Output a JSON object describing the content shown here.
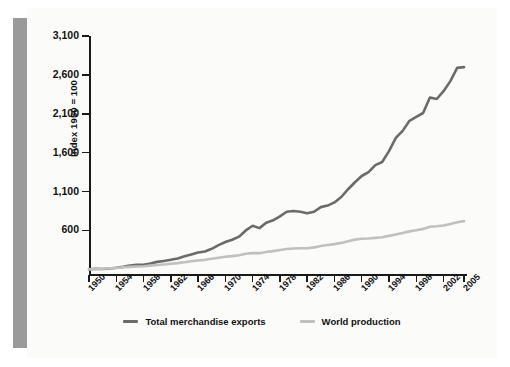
{
  "figure": {
    "ylabel": "Index 1950 = 100"
  },
  "legend": {
    "items": [
      {
        "label": "Total merchandise exports",
        "color": "#6b6b6b",
        "key": "exports"
      },
      {
        "label": "World production",
        "color": "#c0c0c0",
        "key": "production"
      }
    ]
  },
  "chart_data": {
    "type": "line",
    "title": "",
    "xlabel": "",
    "ylabel": "Index 1950 = 100",
    "grid": false,
    "legend_position": "bottom-center",
    "xlim": [
      1950,
      2005
    ],
    "ylim": [
      40,
      3100
    ],
    "yticks": [
      600,
      1100,
      1600,
      2100,
      2600,
      3100
    ],
    "ytick_labels": [
      "600",
      "1,100",
      "1,600",
      "2,100",
      "2,600",
      "3,100"
    ],
    "xticks": [
      1950,
      1954,
      1958,
      1962,
      1966,
      1970,
      1974,
      1978,
      1982,
      1986,
      1990,
      1994,
      1998,
      2002,
      2005
    ],
    "xtick_labels": [
      "1950",
      "1954",
      "1958",
      "1962",
      "1966",
      "1970",
      "1974",
      "1978",
      "1982",
      "1986",
      "1990",
      "1994",
      "1998",
      "2002",
      "2005"
    ],
    "x": [
      1950,
      1951,
      1952,
      1953,
      1954,
      1955,
      1956,
      1957,
      1958,
      1959,
      1960,
      1961,
      1962,
      1963,
      1964,
      1965,
      1966,
      1967,
      1968,
      1969,
      1970,
      1971,
      1972,
      1973,
      1974,
      1975,
      1976,
      1977,
      1978,
      1979,
      1980,
      1981,
      1982,
      1983,
      1984,
      1985,
      1986,
      1987,
      1988,
      1989,
      1990,
      1991,
      1992,
      1993,
      1994,
      1995,
      1996,
      1997,
      1998,
      1999,
      2000,
      2001,
      2002,
      2003,
      2004,
      2005
    ],
    "series": [
      {
        "name": "Total merchandise exports",
        "color": "#6b6b6b",
        "values": [
          100,
          107,
          105,
          110,
          120,
          132,
          148,
          158,
          158,
          174,
          196,
          208,
          222,
          240,
          268,
          292,
          316,
          330,
          364,
          412,
          452,
          480,
          520,
          600,
          660,
          630,
          700,
          730,
          780,
          840,
          850,
          840,
          820,
          840,
          900,
          920,
          960,
          1030,
          1130,
          1220,
          1300,
          1350,
          1440,
          1480,
          1620,
          1790,
          1880,
          2010,
          2060,
          2110,
          2310,
          2290,
          2390,
          2520,
          2690,
          2700
        ]
      },
      {
        "name": "World production",
        "color": "#c0c0c0",
        "values": [
          100,
          105,
          108,
          113,
          118,
          126,
          132,
          137,
          140,
          148,
          156,
          163,
          172,
          180,
          192,
          203,
          214,
          222,
          236,
          250,
          262,
          270,
          282,
          300,
          308,
          308,
          322,
          334,
          348,
          362,
          368,
          372,
          372,
          382,
          400,
          412,
          424,
          440,
          462,
          482,
          494,
          496,
          504,
          512,
          530,
          548,
          566,
          588,
          602,
          620,
          648,
          654,
          664,
          682,
          706,
          720
        ]
      }
    ]
  }
}
